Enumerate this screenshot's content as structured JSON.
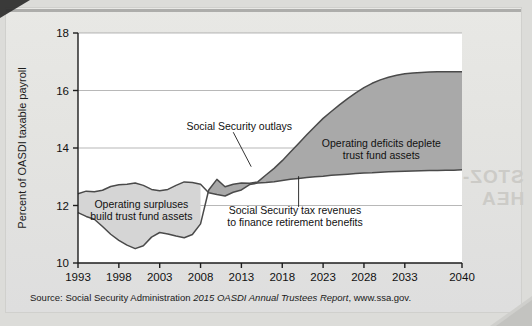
{
  "figure": {
    "source_prefix": "Source: Social Security Administration ",
    "source_italic": "2015 OASDI Annual Trustees Report",
    "source_suffix": ", www.ssa.gov."
  },
  "bleed": {
    "right_top": "STOZ-",
    "right_top2": "HEA"
  },
  "chart_data": {
    "type": "area",
    "title": "",
    "xlabel": "",
    "ylabel": "Percent of OASDI taxable payroll",
    "xlim": [
      1993,
      2040
    ],
    "ylim": [
      10,
      18
    ],
    "grid": true,
    "legend_position": "none",
    "yticks": [
      10,
      12,
      14,
      16,
      18
    ],
    "ytick_labels": [
      "10",
      "12",
      "14",
      "16",
      "18"
    ],
    "xticks": [
      1993,
      1998,
      2003,
      2008,
      2013,
      2018,
      2023,
      2028,
      2033,
      2040
    ],
    "xtick_labels": [
      "1993",
      "1998",
      "2003",
      "2008",
      "2013",
      "2018",
      "2023",
      "2028",
      "2033",
      "2040"
    ],
    "colors": {
      "surplus_fill": "#d5d5d5",
      "deficit_fill": "#a9a9a9",
      "line": "#4a4a4a",
      "axis": "#1d1d1d",
      "grid": "#9a9a9a",
      "plot_bg": "#ffffff"
    },
    "x": [
      1993,
      1994,
      1995,
      1996,
      1997,
      1998,
      1999,
      2000,
      2001,
      2002,
      2003,
      2004,
      2005,
      2006,
      2007,
      2008,
      2009,
      2010,
      2011,
      2012,
      2013,
      2014,
      2015,
      2016,
      2017,
      2018,
      2019,
      2020,
      2021,
      2022,
      2023,
      2024,
      2025,
      2026,
      2027,
      2028,
      2029,
      2030,
      2031,
      2032,
      2033,
      2034,
      2035,
      2036,
      2037,
      2038,
      2039,
      2040
    ],
    "series": [
      {
        "name": "Social Security tax revenues to finance retirement benefits",
        "annotation": "Social Security tax revenues to finance retirement benefits",
        "values": [
          12.41,
          12.5,
          12.48,
          12.53,
          12.66,
          12.72,
          12.74,
          12.78,
          12.7,
          12.56,
          12.51,
          12.56,
          12.7,
          12.82,
          12.8,
          12.74,
          12.44,
          12.38,
          12.33,
          12.46,
          12.54,
          12.73,
          12.78,
          12.8,
          12.83,
          12.87,
          12.91,
          12.94,
          12.97,
          13.0,
          13.02,
          13.05,
          13.07,
          13.09,
          13.11,
          13.13,
          13.14,
          13.16,
          13.17,
          13.18,
          13.19,
          13.2,
          13.21,
          13.22,
          13.22,
          13.23,
          13.23,
          13.24
        ]
      },
      {
        "name": "Social Security outlays",
        "annotation": "Social Security outlays",
        "values": [
          11.75,
          11.62,
          11.52,
          11.27,
          11.0,
          10.79,
          10.62,
          10.5,
          10.6,
          10.9,
          11.06,
          11.01,
          10.94,
          10.88,
          10.99,
          11.36,
          12.54,
          12.91,
          12.65,
          12.74,
          12.78,
          12.77,
          12.82,
          13.06,
          13.29,
          13.56,
          13.86,
          14.16,
          14.46,
          14.75,
          15.03,
          15.27,
          15.5,
          15.72,
          15.92,
          16.1,
          16.25,
          16.37,
          16.46,
          16.53,
          16.58,
          16.61,
          16.63,
          16.64,
          16.65,
          16.65,
          16.65,
          16.65
        ]
      }
    ],
    "annotations": [
      {
        "id": "surplus-annotation",
        "lines": [
          "Operating surpluses",
          "build trust fund assets"
        ],
        "x_frac": 0.165,
        "y_value": 11.92
      },
      {
        "id": "deficit-annotation",
        "lines": [
          "Operating deficits deplete",
          "trust fund assets"
        ],
        "x_frac": 0.79,
        "y_value": 14.05
      },
      {
        "id": "outlays-annotation",
        "lines": [
          "Social Security outlays"
        ],
        "x_frac": 0.42,
        "y_value": 14.62
      },
      {
        "id": "revenues-annotation",
        "lines": [
          "Social Security tax revenues",
          "to finance retirement benefits"
        ],
        "x_frac": 0.565,
        "y_value": 11.72
      }
    ]
  }
}
